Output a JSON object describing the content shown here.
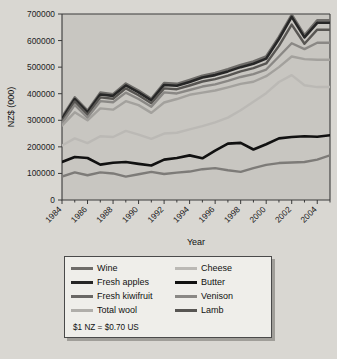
{
  "chart_data": {
    "type": "line",
    "title": "",
    "xlabel": "Year",
    "ylabel": "NZ$ (000)",
    "xlim": [
      1984,
      2005
    ],
    "ylim": [
      0,
      700000
    ],
    "ytick_labels": [
      "0",
      "100000",
      "200000",
      "300000",
      "400000",
      "500000",
      "600000",
      "700000"
    ],
    "ytick_values": [
      0,
      100000,
      200000,
      300000,
      400000,
      500000,
      600000,
      700000
    ],
    "xtick_labels": [
      "1984",
      "1986",
      "1988",
      "1990",
      "1992",
      "1994",
      "1996",
      "1998",
      "2000",
      "2002",
      "2004"
    ],
    "xtick_values": [
      1984,
      1986,
      1988,
      1990,
      1992,
      1994,
      1996,
      1998,
      2000,
      2002,
      2004
    ],
    "grid": false,
    "legend_position": "below-plot",
    "note": "$1 NZ = $0.70 US",
    "x": [
      1984,
      1985,
      1986,
      1987,
      1988,
      1989,
      1990,
      1991,
      1992,
      1993,
      1994,
      1995,
      1996,
      1997,
      1998,
      1999,
      2000,
      2001,
      2002,
      2003,
      2004,
      2005
    ],
    "series": [
      {
        "name": "Wine",
        "color": "#6e6c69",
        "width": 2.6,
        "values": [
          312000,
          386000,
          336000,
          404000,
          398000,
          438000,
          412000,
          381000,
          440000,
          437000,
          452000,
          468000,
          478000,
          492000,
          508000,
          521000,
          540000,
          614000,
          697000,
          620000,
          676000,
          676000
        ]
      },
      {
        "name": "Fresh apples",
        "color": "#262626",
        "width": 2.6,
        "values": [
          305000,
          380000,
          330000,
          397000,
          392000,
          431000,
          405000,
          375000,
          433000,
          430000,
          444000,
          461000,
          470000,
          484000,
          500000,
          513000,
          532000,
          606000,
          689000,
          612000,
          667000,
          667000
        ]
      },
      {
        "name": "Lamb",
        "color": "#585653",
        "width": 2.4,
        "values": [
          297000,
          371000,
          321000,
          386000,
          381000,
          420000,
          394000,
          364000,
          420000,
          417000,
          431000,
          446000,
          455000,
          468000,
          484000,
          496000,
          514000,
          580000,
          660000,
          588000,
          641000,
          641000
        ]
      },
      {
        "name": "Venison",
        "color": "#8a8885",
        "width": 2.4,
        "values": [
          288000,
          358000,
          310000,
          372000,
          368000,
          404000,
          380000,
          351000,
          405000,
          401000,
          414000,
          427000,
          435000,
          448000,
          463000,
          474000,
          491000,
          540000,
          590000,
          568000,
          592000,
          592000
        ]
      },
      {
        "name": "Fresh kiwifruit",
        "color": "#a3a19d",
        "width": 2.4,
        "values": [
          280000,
          330000,
          300000,
          345000,
          340000,
          372000,
          357000,
          328000,
          367000,
          380000,
          396000,
          404000,
          412000,
          424000,
          437000,
          445000,
          466000,
          500000,
          540000,
          530000,
          528000,
          528000
        ]
      },
      {
        "name": "Cheese",
        "color": "#bbb9b5",
        "width": 2.4,
        "values": [
          205000,
          232000,
          214000,
          240000,
          237000,
          260000,
          246000,
          230000,
          250000,
          253000,
          266000,
          278000,
          292000,
          310000,
          338000,
          370000,
          402000,
          444000,
          470000,
          432000,
          425000,
          425000
        ]
      },
      {
        "name": "Butter",
        "color": "#111111",
        "width": 2.6,
        "values": [
          143000,
          162000,
          158000,
          133000,
          140000,
          143000,
          136000,
          130000,
          152000,
          158000,
          168000,
          157000,
          186000,
          212000,
          215000,
          190000,
          210000,
          232000,
          237000,
          240000,
          238000,
          244000
        ]
      },
      {
        "name": "Total wool",
        "color": "#7d7b78",
        "width": 2.4,
        "values": [
          88000,
          104000,
          93000,
          104000,
          100000,
          88000,
          97000,
          106000,
          98000,
          103000,
          107000,
          116000,
          120000,
          112000,
          106000,
          120000,
          132000,
          139000,
          141000,
          143000,
          152000,
          168000
        ]
      }
    ]
  },
  "legend": {
    "items": [
      {
        "label": "Wine",
        "color": "#6e6c69"
      },
      {
        "label": "Cheese",
        "color": "#bbb9b5"
      },
      {
        "label": "Fresh apples",
        "color": "#262626"
      },
      {
        "label": "Butter",
        "color": "#111111"
      },
      {
        "label": "Fresh kiwifruit",
        "color": "#6a6865"
      },
      {
        "label": "Venison",
        "color": "#8a8885"
      },
      {
        "label": "Total wool",
        "color": "#b0aeaa"
      },
      {
        "label": "Lamb",
        "color": "#585653"
      }
    ],
    "note": "$1 NZ = $0.70 US"
  }
}
